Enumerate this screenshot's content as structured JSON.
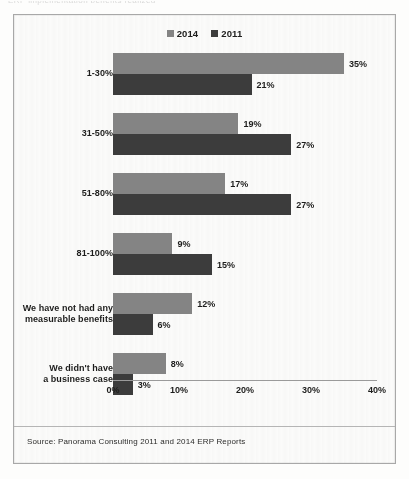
{
  "scan": {
    "top_sliver_text": "ERP implementation benefits realized"
  },
  "legend": {
    "entries": [
      {
        "label": "2014",
        "color": "#848484",
        "swatch_name": "legend-swatch-2014"
      },
      {
        "label": "2011",
        "color": "#3c3c3c",
        "swatch_name": "legend-swatch-2011"
      }
    ]
  },
  "footer": {
    "source": "Source: Panorama  Consulting 2011 and 2014 ERP Reports"
  },
  "axis": {
    "ticks": [
      "0%",
      "10%",
      "20%",
      "30%",
      "40%"
    ]
  },
  "chart_data": {
    "type": "bar",
    "orientation": "horizontal",
    "title": "",
    "subtitle": "",
    "xlabel": "",
    "ylabel": "",
    "xlim": [
      0,
      40
    ],
    "xtick_step": 10,
    "grid": false,
    "legend_position": "top-center",
    "value_label_suffix": "%",
    "categories": [
      "1-30%",
      "31-50%",
      "51-80%",
      "81-100%",
      "We have not had any measurable benefits",
      "We didn't have a business case"
    ],
    "category_lines": [
      [
        "1-30%"
      ],
      [
        "31-50%"
      ],
      [
        "51-80%"
      ],
      [
        "81-100%"
      ],
      [
        "We have not had any",
        "measurable benefits"
      ],
      [
        "We didn't have",
        "a business case"
      ]
    ],
    "series": [
      {
        "name": "2014",
        "color": "#848484",
        "values": [
          35,
          19,
          17,
          9,
          12,
          8
        ],
        "labels": [
          "35%",
          "19%",
          "17%",
          "9%",
          "12%",
          "8%"
        ]
      },
      {
        "name": "2011",
        "color": "#3c3c3c",
        "values": [
          21,
          27,
          27,
          15,
          6,
          3
        ],
        "labels": [
          "21%",
          "27%",
          "27%",
          "15%",
          "6%",
          "3%"
        ]
      }
    ],
    "source": "Source: Panorama  Consulting 2011 and 2014 ERP Reports"
  }
}
